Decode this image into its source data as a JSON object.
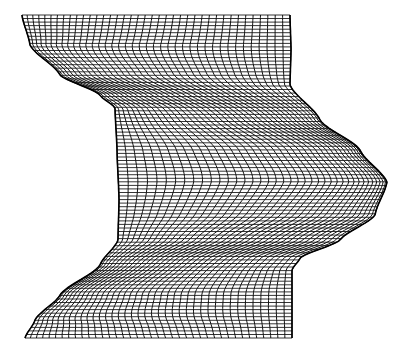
{
  "figure": {
    "stroke_color": "#111111",
    "background": "#ffffff",
    "mesh": {
      "horizontal_lines": 92,
      "vertical_lines": 40,
      "top_y": 15,
      "bottom_y": 338
    },
    "left_boundary": [
      [
        22,
        15
      ],
      [
        30,
        45
      ],
      [
        60,
        75
      ],
      [
        100,
        95
      ],
      [
        115,
        108
      ],
      [
        117,
        150
      ],
      [
        119,
        200
      ],
      [
        118,
        240
      ],
      [
        100,
        265
      ],
      [
        60,
        295
      ],
      [
        35,
        320
      ],
      [
        25,
        338
      ]
    ],
    "right_boundary": [
      [
        290,
        15
      ],
      [
        291,
        50
      ],
      [
        290,
        85
      ],
      [
        320,
        120
      ],
      [
        360,
        150
      ],
      [
        387,
        182
      ],
      [
        375,
        215
      ],
      [
        340,
        240
      ],
      [
        300,
        258
      ],
      [
        292,
        270
      ],
      [
        292,
        338
      ]
    ]
  }
}
